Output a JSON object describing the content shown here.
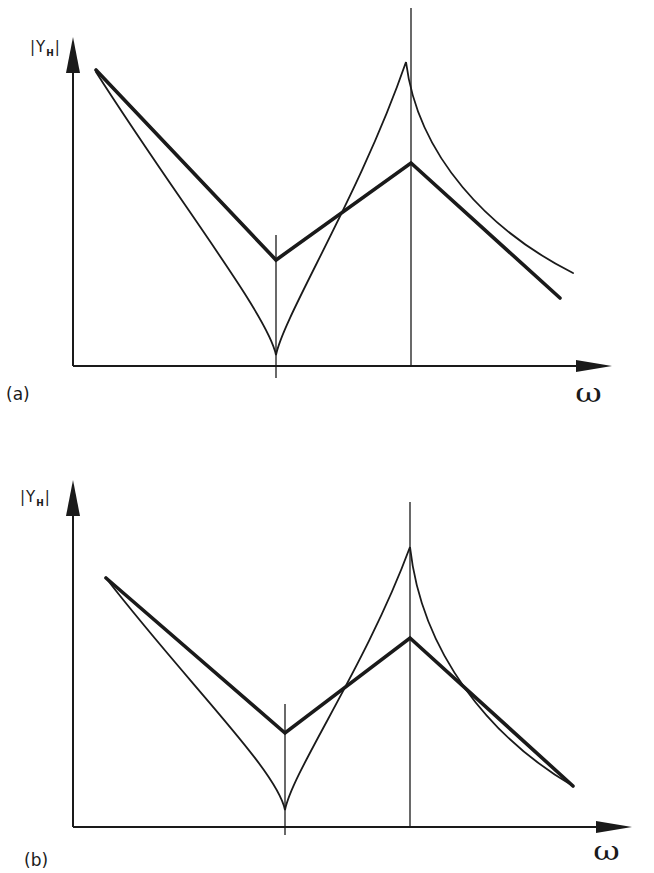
{
  "figure": {
    "background": "#ffffff",
    "ink_color": "#1a1a1a",
    "panels": [
      {
        "tag": "(a)",
        "ylabel": "|Y",
        "ylabel_sub": "H",
        "ylabel_close": "|",
        "xlabel": "ω"
      },
      {
        "tag": "(b)",
        "ylabel": "|Y",
        "ylabel_sub": "H",
        "ylabel_close": "|",
        "xlabel": "ω"
      }
    ]
  },
  "chart_data": [
    {
      "type": "line",
      "title": "(a)",
      "xlabel": "ω",
      "ylabel": "|Y_H|",
      "grid": false,
      "legend": null,
      "axes_px": {
        "origin": [
          73,
          366
        ],
        "x_end": 612,
        "y_top": 37
      },
      "markers": [
        {
          "name": "antiresonance",
          "x": 276,
          "y_top": 235,
          "y_bottom": 378
        },
        {
          "name": "resonance",
          "x": 411,
          "y_top": 8,
          "y_bottom": 366
        }
      ],
      "series": [
        {
          "name": "asymptotes (thick)",
          "style": "thick",
          "points": [
            [
              96,
              70
            ],
            [
              276,
              260
            ],
            [
              411,
              163
            ],
            [
              560,
              298
            ]
          ]
        },
        {
          "name": "exact response (thin)",
          "style": "thin",
          "points": [
            [
              96,
              72
            ],
            [
              276,
              355
            ],
            [
              406,
              62
            ],
            [
              573,
              273
            ]
          ]
        }
      ]
    },
    {
      "type": "line",
      "title": "(b)",
      "xlabel": "ω",
      "ylabel": "|Y_H|",
      "grid": false,
      "legend": null,
      "axes_px": {
        "origin": [
          73,
          827
        ],
        "x_end": 632,
        "y_top": 480
      },
      "markers": [
        {
          "name": "antiresonance",
          "x": 285,
          "y_top": 704,
          "y_bottom": 835
        },
        {
          "name": "resonance",
          "x": 410,
          "y_top": 502,
          "y_bottom": 827
        }
      ],
      "series": [
        {
          "name": "asymptotes (thick)",
          "style": "thick",
          "points": [
            [
              106,
              578
            ],
            [
              285,
              733
            ],
            [
              410,
              638
            ],
            [
              573,
              786
            ]
          ]
        },
        {
          "name": "exact response (thin)",
          "style": "thin",
          "points": [
            [
              106,
              578
            ],
            [
              285,
              810
            ],
            [
              410,
              547
            ],
            [
              573,
              786
            ]
          ]
        }
      ]
    }
  ]
}
